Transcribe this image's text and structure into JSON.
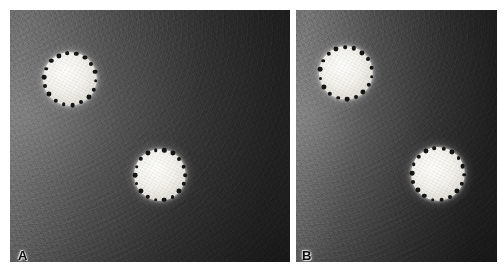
{
  "figure": {
    "type": "two-panel-grayscale-image",
    "width": 504,
    "height": 280,
    "background_color": "#ffffff",
    "panel_count": 2
  },
  "panels": [
    {
      "label": "A",
      "label_position": {
        "x": 18,
        "y": 249
      },
      "bounds": {
        "x": 10,
        "y": 10,
        "width": 280,
        "height": 252
      },
      "background_description": "dark grainy gradient, brighter at left edge",
      "background_color_light": "#6a6a6a",
      "background_color_dark": "#262626",
      "objects": [
        {
          "name": "bright-disc-upper-left",
          "center_x": 70,
          "center_y": 79,
          "radius": 27,
          "fill_color": "#f2f1ec",
          "marker_count": 18,
          "marker_color": "#141414",
          "marker_radius": 2.1,
          "marker_ring_radius": 26,
          "marker_start_angle": -96
        },
        {
          "name": "bright-disc-lower-right",
          "center_x": 160,
          "center_y": 175,
          "radius": 26,
          "fill_color": "#f2f1ec",
          "marker_count": 18,
          "marker_color": "#141414",
          "marker_radius": 2.1,
          "marker_ring_radius": 25,
          "marker_start_angle": -100
        }
      ]
    },
    {
      "label": "B",
      "label_position": {
        "x": 302,
        "y": 249
      },
      "bounds": {
        "x": 296,
        "y": 10,
        "width": 201,
        "height": 252
      },
      "background_description": "dark grainy gradient, brighter at left edge",
      "background_color_light": "#707070",
      "background_color_dark": "#242424",
      "objects": [
        {
          "name": "bright-disc-upper-left",
          "center_x": 346,
          "center_y": 73,
          "radius": 27,
          "fill_color": "#f2f1ec",
          "marker_count": 18,
          "marker_color": "#141414",
          "marker_radius": 2.1,
          "marker_ring_radius": 26,
          "marker_start_angle": -92
        },
        {
          "name": "bright-disc-lower-right",
          "center_x": 438,
          "center_y": 174,
          "radius": 27,
          "fill_color": "#f2f1ec",
          "marker_count": 18,
          "marker_color": "#141414",
          "marker_radius": 2.1,
          "marker_ring_radius": 26,
          "marker_start_angle": -98
        }
      ]
    }
  ],
  "divider": {
    "name": "panel-divider",
    "x": 290,
    "width": 6,
    "color": "#ffffff"
  }
}
